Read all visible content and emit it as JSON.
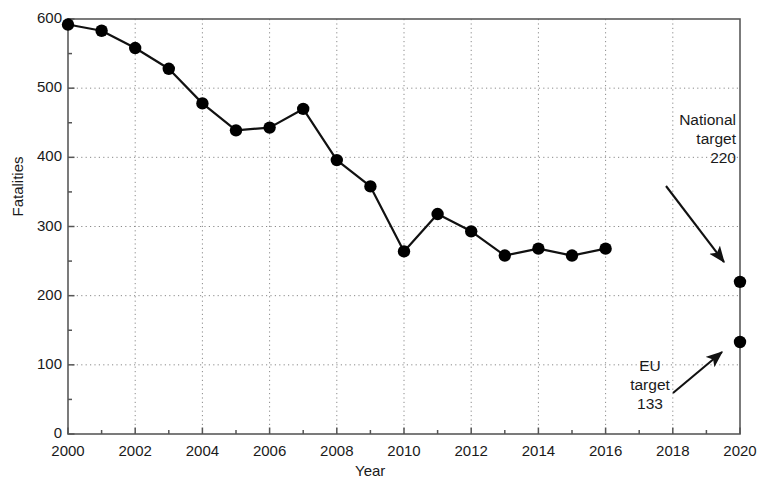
{
  "chart_data": {
    "type": "line",
    "title": "",
    "xlabel": "Year",
    "ylabel": "Fatalities",
    "xlim": [
      2000,
      2020
    ],
    "ylim": [
      0,
      600
    ],
    "grid": true,
    "legend": "none",
    "x_major_ticks": [
      2000,
      2002,
      2004,
      2006,
      2008,
      2010,
      2012,
      2014,
      2016,
      2018,
      2020
    ],
    "x_tick_labels": [
      "2000",
      "2002",
      "2004",
      "2006",
      "2008",
      "2010",
      "2012",
      "2014",
      "2016",
      "2018",
      "2020"
    ],
    "x_minor_tick_step": 1,
    "y_major_ticks": [
      0,
      100,
      200,
      300,
      400,
      500,
      600
    ],
    "y_tick_labels": [
      "0",
      "100",
      "200",
      "300",
      "400",
      "500",
      "600"
    ],
    "y_minor_tick_step": 50,
    "series": [
      {
        "name": "Fatalities",
        "style": "line-with-markers",
        "x": [
          2000,
          2001,
          2002,
          2003,
          2004,
          2005,
          2006,
          2007,
          2008,
          2009,
          2010,
          2011,
          2012,
          2013,
          2014,
          2015,
          2016
        ],
        "values": [
          592,
          583,
          558,
          528,
          478,
          439,
          443,
          470,
          396,
          358,
          264,
          318,
          293,
          258,
          268,
          258,
          268
        ]
      },
      {
        "name": "Targets",
        "style": "markers-only",
        "x": [
          2020,
          2020
        ],
        "values": [
          220,
          133
        ]
      }
    ],
    "annotations": [
      {
        "name": "national-target",
        "lines": [
          "National",
          "target",
          "220"
        ],
        "text": "National target 220",
        "value": 220,
        "year": 2020,
        "arrow": "down-right"
      },
      {
        "name": "eu-target",
        "lines": [
          "EU",
          "target",
          "133"
        ],
        "text": "EU target 133",
        "value": 133,
        "year": 2020,
        "arrow": "up-right"
      }
    ],
    "colors": {
      "line": "#111111",
      "marker": "#000000",
      "grid": "#8a8a8a",
      "axis": "#555555",
      "text": "#1a1a1a",
      "background": "#ffffff"
    }
  }
}
